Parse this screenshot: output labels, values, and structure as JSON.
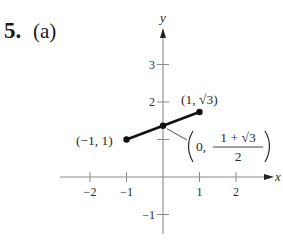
{
  "problem": {
    "number": "5.",
    "part": "(a)"
  },
  "colors": {
    "axis": "#8a8a8a",
    "segment": "#111111",
    "text": "#2a2a2a",
    "leader": "#555555"
  },
  "chart_data": {
    "type": "line",
    "title": "",
    "xlabel": "x",
    "ylabel": "y",
    "xlim": [
      -2.5,
      3
    ],
    "ylim": [
      -1.5,
      3.7
    ],
    "grid": false,
    "x_ticks": [
      -2,
      -1,
      1,
      2
    ],
    "x_tick_labels": [
      "−2",
      "−1",
      "1",
      "2"
    ],
    "y_ticks": [
      -1,
      1,
      2,
      3
    ],
    "y_tick_labels": [
      "−1",
      "",
      "2",
      "3"
    ],
    "series": [
      {
        "name": "segment",
        "x": [
          -1,
          0,
          1
        ],
        "y": [
          1,
          1.366,
          1.732
        ]
      }
    ],
    "points": [
      {
        "x": -1,
        "y": 1,
        "label": "(−1, 1)"
      },
      {
        "x": 0,
        "y": 1.366,
        "label": "(0, (1 + √3)/2)"
      },
      {
        "x": 1,
        "y": 1.732,
        "label": "(1, √3)"
      }
    ],
    "annotations": {
      "left_point": "(−1, 1)",
      "right_point": "(1, √3)",
      "midpoint_prefix": "0,",
      "midpoint_numerator": "1 + √3",
      "midpoint_denominator": "2"
    }
  }
}
